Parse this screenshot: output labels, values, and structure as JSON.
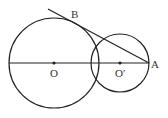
{
  "diagram": {
    "type": "geometry",
    "stroke_color": "#222222",
    "background": "#ffffff",
    "circles": [
      {
        "name": "circle-O",
        "center": "O",
        "cx": 54,
        "cy": 63,
        "r": 45
      },
      {
        "name": "circle-O-prime",
        "center": "O'",
        "cx": 120,
        "cy": 63,
        "r": 29
      }
    ],
    "segments": [
      {
        "name": "diameter-line",
        "x1": 9,
        "y1": 63,
        "x2": 149,
        "y2": 63
      },
      {
        "name": "tangent-line-AB",
        "x1": 48,
        "y1": 9,
        "x2": 149,
        "y2": 63
      }
    ],
    "points": [
      {
        "name": "O",
        "x": 54,
        "y": 63
      },
      {
        "name": "O'",
        "x": 120,
        "y": 63
      }
    ],
    "labels": {
      "B": "B",
      "O": "O",
      "O_prime": "O′",
      "A": "A"
    }
  }
}
